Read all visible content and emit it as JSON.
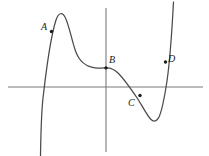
{
  "figure": {
    "background_color": "#ffffff",
    "width": 209,
    "height": 156
  },
  "axes": {
    "axis_color": "#7a7a7a",
    "x_axis": {
      "name": "horizontal-axis",
      "y": 87,
      "x_start": 8,
      "x_end": 203
    },
    "y_axis": {
      "name": "vertical-axis",
      "x": 106,
      "y_start": 8,
      "y_end": 152
    },
    "origin": {
      "x": 106,
      "y": 87
    }
  },
  "curve": {
    "name": "cubic-curve",
    "color": "#4a4a4a",
    "stroke_width": 1.25,
    "description": "S-shaped cubic-like curve rising from lower left, local maximum near top left, flat inflection at B on the vertical axis, local minimum at lower right, then rising steeply off the top right",
    "path": "M 40.5 156 C 40.8 140 41.0 112 43.6 93 C 46.5 68 51.5 34 56.0 20 C 58.5 12.5 62.5 11.5 65.5 18 C 69.5 27 72.0 41 75.5 51 C 79.5 62 85.5 66.5 95.0 67.8 C 100.0 68.4 103.5 68.0 106.0 67.9 C 110.5 67.7 114.5 69.5 118.5 73.5 C 124.5 79.5 131.0 89.0 137.5 98.5 C 142.0 105.5 146.5 114.5 150.5 119.0 C 153.5 122.0 156.5 122.0 159.0 117.0 C 162.0 110.5 164.5 97.5 167.0 81.0 C 169.5 63.5 172.0 30.0 173.5 2.0"
  },
  "points": [
    {
      "id": "A",
      "label": "A",
      "dot": {
        "x": 51.5,
        "y": 31.5
      },
      "label_pos": {
        "x": 41,
        "y": 22
      },
      "role": "point on rising branch left of local maximum"
    },
    {
      "id": "B",
      "label": "B",
      "dot": {
        "x": 106,
        "y": 67.9
      },
      "label_pos": {
        "x": 109,
        "y": 55
      },
      "role": "inflection point on the vertical axis"
    },
    {
      "id": "C",
      "label": "C",
      "dot": {
        "x": 140,
        "y": 95.5
      },
      "label_pos": {
        "x": 128,
        "y": 98
      },
      "role": "point on descending branch below the horizontal axis"
    },
    {
      "id": "D",
      "label": "D",
      "dot": {
        "x": 165.5,
        "y": 62
      },
      "label_pos": {
        "x": 168,
        "y": 54
      },
      "role": "point on the steeply rising right branch"
    }
  ]
}
